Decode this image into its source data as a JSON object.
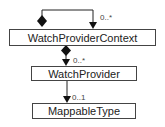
{
  "diagram": {
    "type": "uml-class",
    "classes": [
      {
        "id": "ctx",
        "name": "WatchProviderContext"
      },
      {
        "id": "wp",
        "name": "WatchProvider"
      },
      {
        "id": "mt",
        "name": "MappableType"
      }
    ],
    "associations": [
      {
        "from": "ctx",
        "to": "ctx",
        "kind": "composition",
        "multiplicity": "0..*"
      },
      {
        "from": "ctx",
        "to": "wp",
        "kind": "composition",
        "multiplicity": "0..*"
      },
      {
        "from": "wp",
        "to": "mt",
        "kind": "directed",
        "multiplicity": "0..1"
      }
    ]
  }
}
